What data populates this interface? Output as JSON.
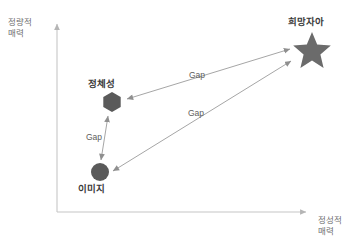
{
  "diagram": {
    "axes": {
      "y_axis": {
        "name": "y-axis",
        "label_line1": "정량적",
        "label_line2": "매력",
        "color": "#bfbfbf"
      },
      "x_axis": {
        "name": "x-axis",
        "label_line1": "정성적",
        "label_line2": "매력",
        "color": "#bfbfbf"
      }
    },
    "nodes": [
      {
        "id": "identity",
        "label": "정체성",
        "shape": "hexagon",
        "color": "#5a5a5a",
        "x": 112,
        "y": 102
      },
      {
        "id": "image",
        "label": "이미지",
        "shape": "circle",
        "color": "#5a5a5a",
        "x": 100,
        "y": 172
      },
      {
        "id": "desired_self",
        "label": "희망자아",
        "shape": "star",
        "color": "#6b6b6b",
        "x": 312,
        "y": 50
      }
    ],
    "connectors": [
      {
        "id": "gap_identity_desired",
        "label": "Gap",
        "from": "identity",
        "to": "desired_self",
        "arrow": "double",
        "color": "#9a9a9a"
      },
      {
        "id": "gap_image_desired",
        "label": "Gap",
        "from": "image",
        "to": "desired_self",
        "arrow": "double",
        "color": "#9a9a9a"
      },
      {
        "id": "gap_image_identity",
        "label": "Gap",
        "from": "image",
        "to": "identity",
        "arrow": "double",
        "color": "#9a9a9a"
      }
    ]
  }
}
